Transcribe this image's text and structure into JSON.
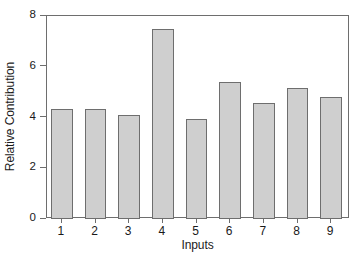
{
  "chart_data": {
    "type": "bar",
    "title": "",
    "xlabel": "Inputs",
    "ylabel": "Relative Contribution",
    "categories": [
      "1",
      "2",
      "3",
      "4",
      "5",
      "6",
      "7",
      "8",
      "9"
    ],
    "values": [
      4.35,
      4.32,
      4.1,
      7.48,
      3.93,
      5.38,
      4.58,
      5.18,
      4.82
    ],
    "ylim": [
      0,
      8
    ],
    "yticks": [
      0,
      2,
      4,
      6,
      8
    ],
    "ytick_labels": [
      "0",
      "2",
      "4",
      "6",
      "8"
    ],
    "grid": false,
    "legend": false,
    "legend_position": "none",
    "bar_fill_color": "#cfcfcf",
    "bar_edge_color": "#6e6e6e",
    "axis_color": "#6e6e6e",
    "background_color": "#ffffff"
  }
}
